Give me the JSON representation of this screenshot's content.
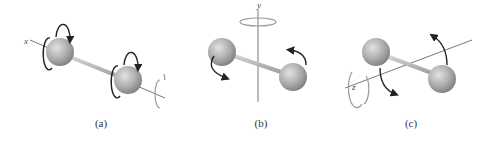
{
  "figure": {
    "colors": {
      "sphere_light": "#e0e0e0",
      "sphere_dark": "#8a8a8a",
      "rod": "#b5b5b5",
      "axis_line": "#555555",
      "arrow": "#222222",
      "faint_arrow": "#9a9a9a"
    },
    "panels": [
      {
        "id": "a",
        "label": "(a)",
        "axis": "x",
        "rotation_about": "x-axis (along the bond)"
      },
      {
        "id": "b",
        "label": "(b)",
        "axis": "y",
        "rotation_about": "y-axis (perpendicular, vertical)"
      },
      {
        "id": "c",
        "label": "(c)",
        "axis": "z",
        "rotation_about": "z-axis (perpendicular, depth)"
      }
    ]
  }
}
